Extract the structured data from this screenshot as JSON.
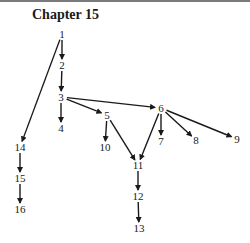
{
  "title": "Chapter 15",
  "nodes": [
    {
      "id": "1",
      "x": 62,
      "y": 34
    },
    {
      "id": "2",
      "x": 62,
      "y": 65
    },
    {
      "id": "3",
      "x": 61,
      "y": 97
    },
    {
      "id": "4",
      "x": 61,
      "y": 128
    },
    {
      "id": "5",
      "x": 107,
      "y": 115
    },
    {
      "id": "6",
      "x": 161,
      "y": 108
    },
    {
      "id": "7",
      "x": 161,
      "y": 141
    },
    {
      "id": "8",
      "x": 196,
      "y": 140
    },
    {
      "id": "9",
      "x": 237,
      "y": 139
    },
    {
      "id": "10",
      "x": 105,
      "y": 147
    },
    {
      "id": "11",
      "x": 138,
      "y": 165
    },
    {
      "id": "12",
      "x": 138,
      "y": 196
    },
    {
      "id": "13",
      "x": 139,
      "y": 228
    },
    {
      "id": "14",
      "x": 20,
      "y": 147
    },
    {
      "id": "15",
      "x": 20,
      "y": 178
    },
    {
      "id": "16",
      "x": 20,
      "y": 209
    }
  ],
  "edges": [
    [
      "1",
      "2"
    ],
    [
      "2",
      "3"
    ],
    [
      "3",
      "4"
    ],
    [
      "3",
      "5"
    ],
    [
      "3",
      "6"
    ],
    [
      "5",
      "10"
    ],
    [
      "5",
      "11"
    ],
    [
      "6",
      "11"
    ],
    [
      "6",
      "7"
    ],
    [
      "6",
      "8"
    ],
    [
      "6",
      "9"
    ],
    [
      "11",
      "12"
    ],
    [
      "12",
      "13"
    ],
    [
      "1",
      "14"
    ],
    [
      "14",
      "15"
    ],
    [
      "15",
      "16"
    ]
  ]
}
